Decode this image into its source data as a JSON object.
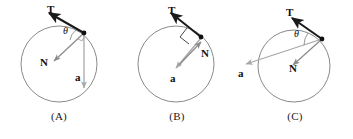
{
  "figure": {
    "background_color": "#ffffff",
    "circle_stroke": "#8a8a8a",
    "tension_color": "#1a1a1a",
    "normal_color": "#8c8c8c",
    "accel_color": "#a8a8a8",
    "ball_color": "#111111"
  },
  "panels": [
    {
      "id": "A",
      "caption": "(A)",
      "labels": {
        "tension": "T",
        "normal": "N",
        "acceleration": "a",
        "angle": "θ"
      },
      "description": "Tension up-left, normal down-left toward interior, acceleration straight down, angle theta between tension and normal at the ball",
      "circle": {
        "cx": 59,
        "cy": 64,
        "r": 38
      },
      "ball": {
        "x": 84,
        "y": 33
      },
      "vectors": [
        {
          "name": "tension",
          "label": "T",
          "from": [
            84,
            33
          ],
          "to": [
            48,
            12
          ],
          "color": "#1a1a1a",
          "width": 2.1
        },
        {
          "name": "normal",
          "label": "N",
          "from": [
            84,
            33
          ],
          "to": [
            53,
            62
          ],
          "color": "#8c8c8c",
          "width": 1.3
        },
        {
          "name": "acceleration",
          "label": "a",
          "from": [
            84,
            36
          ],
          "to": [
            84,
            88
          ],
          "color": "#a8a8a8",
          "width": 1.3
        }
      ],
      "angle_marker": {
        "type": "arc",
        "at": [
          84,
          33
        ],
        "label": "θ"
      },
      "right_angle_marker": false
    },
    {
      "id": "B",
      "caption": "(B)",
      "labels": {
        "tension": "T",
        "normal": "N",
        "acceleration": "a",
        "angle": ""
      },
      "description": "Tension up-left, normal down-left perpendicular to tension with right angle marker, acceleration from ball toward circle center",
      "circle": {
        "cx": 58,
        "cy": 64,
        "r": 38
      },
      "ball": {
        "x": 83,
        "y": 37
      },
      "vectors": [
        {
          "name": "tension",
          "label": "T",
          "from": [
            83,
            37
          ],
          "to": [
            52,
            12
          ],
          "color": "#1a1a1a",
          "width": 2.1
        },
        {
          "name": "normal",
          "label": "N",
          "from": [
            60,
            66
          ],
          "to": [
            84,
            41
          ],
          "color": "#8c8c8c",
          "width": 1.3
        },
        {
          "name": "acceleration",
          "label": "a",
          "from": [
            83,
            38
          ],
          "to": [
            57,
            69
          ],
          "color": "#a8a8a8",
          "width": 1.3
        }
      ],
      "angle_marker": null,
      "right_angle_marker": true
    },
    {
      "id": "C",
      "caption": "(C)",
      "labels": {
        "tension": "T",
        "normal": "N",
        "acceleration": "a",
        "angle": "θ"
      },
      "description": "Tension up-left, normal down-left into interior, acceleration pointing left and slightly down outside the circle, angle theta between tension and acceleration line",
      "circle": {
        "cx": 58,
        "cy": 66,
        "r": 36
      },
      "ball": {
        "x": 86,
        "y": 39
      },
      "vectors": [
        {
          "name": "tension",
          "label": "T",
          "from": [
            86,
            39
          ],
          "to": [
            55,
            17
          ],
          "color": "#1a1a1a",
          "width": 2.1
        },
        {
          "name": "normal",
          "label": "N",
          "from": [
            86,
            39
          ],
          "to": [
            56,
            66
          ],
          "color": "#8c8c8c",
          "width": 1.3
        },
        {
          "name": "acceleration",
          "label": "a",
          "from": [
            86,
            39
          ],
          "to": [
            9,
            64
          ],
          "color": "#a8a8a8",
          "width": 1.3
        }
      ],
      "angle_marker": {
        "type": "arc",
        "at": [
          86,
          39
        ],
        "label": "θ"
      },
      "right_angle_marker": false
    }
  ]
}
